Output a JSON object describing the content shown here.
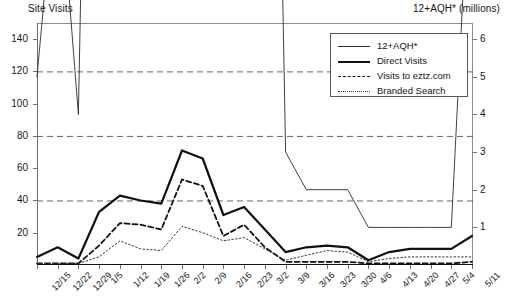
{
  "titles": {
    "left_axis": "Site Visits",
    "right_axis": "12+AQH* (millions)"
  },
  "legend": {
    "items": [
      {
        "label": "12+AQH*",
        "style": "thin-solid",
        "color": "#2b2b2b"
      },
      {
        "label": "Direct Visits",
        "style": "thick-solid",
        "color": "#111111"
      },
      {
        "label": "Visits to eztz.com",
        "style": "dashed",
        "color": "#111111"
      },
      {
        "label": "Branded Search",
        "style": "dotted",
        "color": "#3a3a3a"
      }
    ]
  },
  "chart_data": {
    "type": "line",
    "title": "",
    "xlabel": "",
    "ylabel": "Site Visits",
    "y2label": "12+AQH* (millions)",
    "grid": true,
    "gridlines_y": [
      40,
      80,
      120
    ],
    "legend_position": "top-right-inside",
    "ylim": [
      0,
      150
    ],
    "yticks": [
      20,
      40,
      60,
      80,
      100,
      120,
      140
    ],
    "y2lim": [
      0,
      6.43
    ],
    "y2ticks": [
      1,
      2,
      3,
      4,
      5,
      6
    ],
    "categories": [
      "12/15",
      "12/22",
      "12/29",
      "1/5",
      "1/12",
      "1/19",
      "1/26",
      "2/2",
      "2/9",
      "2/16",
      "2/23",
      "3/2",
      "3/9",
      "3/16",
      "3/23",
      "3/30",
      "4/6",
      "4/13",
      "4/20",
      "4/27",
      "5/4",
      "5/11"
    ],
    "series": [
      {
        "name": "12+AQH*",
        "axis": "right",
        "values": [
          5,
          11,
          4,
          33,
          70,
          65,
          61,
          142,
          83,
          55,
          88,
          33,
          3,
          2,
          2,
          2,
          1,
          1,
          1,
          1,
          1,
          12
        ]
      },
      {
        "name": "Direct Visits",
        "axis": "left",
        "values": [
          5,
          11,
          4,
          33,
          43,
          40,
          38,
          71,
          66,
          31,
          36,
          22,
          8,
          11,
          12,
          11,
          3,
          8,
          10,
          10,
          10,
          18
        ]
      },
      {
        "name": "Visits to eztz.com",
        "axis": "left",
        "values": [
          1,
          1,
          1,
          12,
          26,
          25,
          22,
          53,
          49,
          18,
          25,
          11,
          2,
          2,
          2,
          2,
          1,
          1,
          1,
          1,
          1,
          2
        ]
      },
      {
        "name": "Branded Search",
        "axis": "left",
        "values": [
          1,
          1,
          1,
          5,
          15,
          10,
          9,
          24,
          20,
          15,
          17,
          10,
          3,
          6,
          9,
          8,
          2,
          4,
          5,
          5,
          5,
          5
        ]
      }
    ]
  }
}
